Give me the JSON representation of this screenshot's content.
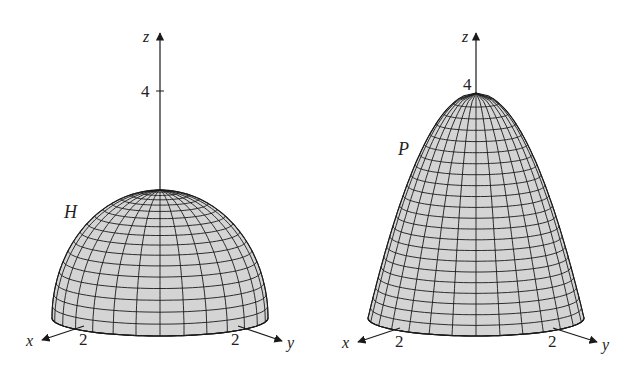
{
  "colors": {
    "surface_fill": "#d4d4d4",
    "mesh_line": "#1a1a1a",
    "axis": "#1a1a1a",
    "background": "#ffffff"
  },
  "panels": [
    {
      "id": "hemisphere",
      "surface_label": "H",
      "surface_type": "hemisphere",
      "axis_labels": {
        "x": "x",
        "y": "y",
        "z": "z"
      },
      "tick_labels": {
        "z": "4",
        "x": "2",
        "y": "2"
      },
      "geometry": {
        "cx": 160,
        "base_y": 318,
        "rx": 108,
        "ry": 18,
        "height": 128,
        "z_top": 33,
        "z4_y": 91
      },
      "mesh": {
        "meridians": 28,
        "parallels": 17
      }
    },
    {
      "id": "paraboloid",
      "surface_label": "P",
      "surface_type": "paraboloid",
      "axis_labels": {
        "x": "x",
        "y": "y",
        "z": "z"
      },
      "tick_labels": {
        "z": "4",
        "x": "2",
        "y": "2"
      },
      "geometry": {
        "cx": 476,
        "base_y": 318,
        "rx": 108,
        "ry": 18,
        "height": 225,
        "z_top": 33,
        "z4_y": 93
      },
      "mesh": {
        "meridians": 28,
        "parallels": 22
      }
    }
  ]
}
